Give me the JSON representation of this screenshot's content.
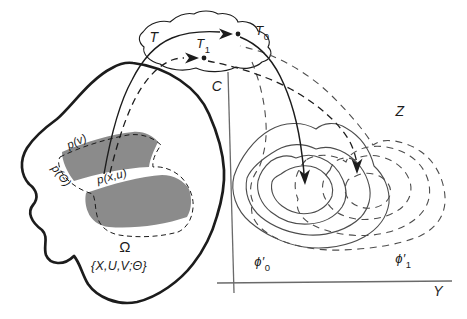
{
  "labels": {
    "t_region": "T",
    "t0": {
      "base": "T",
      "sub": "0"
    },
    "t1": {
      "base": "T",
      "sub": "1"
    },
    "c_axis": "C",
    "z_region": "Z",
    "y_axis": "Y",
    "omega": "Ω",
    "omega_set": "{X,U,V;Θ}",
    "p_v": "p(v)",
    "p_theta": "p(Θ)",
    "p_xu": "p(x,u)",
    "phi0": {
      "base": "ϕ′",
      "sub": "0"
    },
    "phi1": {
      "base": "ϕ′",
      "sub": "1"
    }
  },
  "colors": {
    "ink": "#1c1c1c",
    "contour": "#4d4d4d",
    "band": "#8b8b8b",
    "background": "#ffffff"
  }
}
